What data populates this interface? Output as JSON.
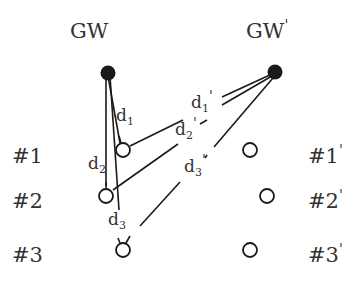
{
  "diagram": {
    "title": "",
    "colors": {
      "stroke": "#1a1a1a",
      "text": "#333333",
      "background": "#ffffff"
    },
    "gateways": [
      {
        "id": "gw",
        "label": "GW",
        "prime": ""
      },
      {
        "id": "gw_prime",
        "label": "GW",
        "prime": "'"
      }
    ],
    "left_nodes": [
      {
        "label": "#1",
        "prime": ""
      },
      {
        "label": "#2",
        "prime": ""
      },
      {
        "label": "#3",
        "prime": ""
      }
    ],
    "right_nodes": [
      {
        "label": "#1",
        "prime": "'"
      },
      {
        "label": "#2",
        "prime": "'"
      },
      {
        "label": "#3",
        "prime": "'"
      }
    ],
    "distances_gw": [
      {
        "base": "d",
        "sub": "1",
        "prime": ""
      },
      {
        "base": "d",
        "sub": "2",
        "prime": ""
      },
      {
        "base": "d",
        "sub": "3",
        "prime": ""
      }
    ],
    "distances_gw_prime": [
      {
        "base": "d",
        "sub": "1",
        "prime": "'"
      },
      {
        "base": "d",
        "sub": "2",
        "prime": "'"
      },
      {
        "base": "d",
        "sub": "3",
        "prime": "'"
      }
    ]
  }
}
